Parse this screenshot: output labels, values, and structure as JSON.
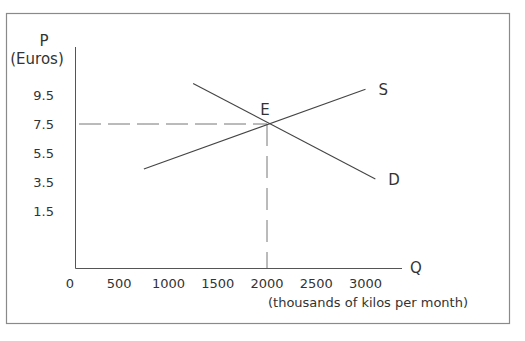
{
  "chart_data": {
    "type": "line",
    "title": "",
    "ylabel": "P",
    "ylabel_unit": "(Euros)",
    "xlabel": "Q",
    "xlabel_unit": "(thousands of kilos per month)",
    "x_ticks": [
      0,
      500,
      1000,
      1500,
      2000,
      2500,
      3000
    ],
    "y_ticks": [
      1.5,
      3.5,
      5.5,
      7.5,
      9.5
    ],
    "xlim": [
      0,
      3300
    ],
    "ylim": [
      0,
      11
    ],
    "grid": false,
    "legend": "none (lines labelled inline)",
    "series": [
      {
        "name": "S",
        "label": "S",
        "description": "Supply curve (upward sloping)",
        "points": [
          [
            750,
            4.4
          ],
          [
            3000,
            9.9
          ]
        ]
      },
      {
        "name": "D",
        "label": "D",
        "description": "Demand curve (downward sloping)",
        "points": [
          [
            1250,
            10.3
          ],
          [
            3100,
            3.7
          ]
        ]
      }
    ],
    "annotations": [
      {
        "label": "E",
        "description": "Equilibrium point",
        "x": 2000,
        "y": 7.5
      },
      {
        "type": "dashed-horizontal",
        "from_x": 0,
        "to_x": 2000,
        "y": 7.5
      },
      {
        "type": "dashed-vertical",
        "x": 2000,
        "from_y": 0,
        "to_y": 7.5
      }
    ]
  },
  "colors": {
    "axis": "#555555",
    "line": "#444444",
    "dash": "#777777",
    "frame": "#888888",
    "text": "#333333"
  }
}
